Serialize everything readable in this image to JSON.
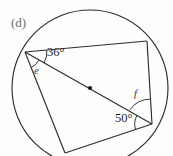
{
  "figure": {
    "part_label": "(d)",
    "background": "#fdfdfc",
    "stroke_color": "#2e2e2e",
    "labels": {
      "angle_36": "36°",
      "angle_50": "50°",
      "angle_e": "e",
      "angle_f": "f"
    },
    "geometry": {
      "circle": {
        "cx": 90,
        "cy": 88,
        "r": 78
      },
      "center_dot": {
        "x": 90,
        "y": 88,
        "r": 2.1
      },
      "vertices": {
        "left": {
          "x": 25,
          "y": 52
        },
        "top_right": {
          "x": 147,
          "y": 41
        },
        "right": {
          "x": 152,
          "y": 124
        },
        "bottom": {
          "x": 65,
          "y": 153
        }
      },
      "diagonal": {
        "from": "left",
        "to": "right",
        "passes_through_center": true
      }
    },
    "arcs": {
      "arc_36_radius": 22,
      "arc_e_radius": 16,
      "arc_50_radius": 17,
      "arc_f_radius": 25
    }
  }
}
